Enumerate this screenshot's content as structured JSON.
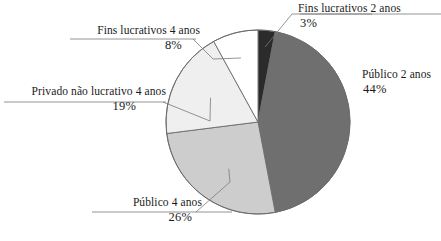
{
  "chart_data": {
    "type": "pie",
    "title": "",
    "subtitle": "",
    "xlabel": "",
    "ylabel": "",
    "legend_position": "callout-labels",
    "grid": false,
    "units": "percent",
    "categories": [
      "Fins lucrativos 2 anos",
      "Público 2 anos",
      "Público 4 anos",
      "Privado não lucrativo 4 anos",
      "Fins lucrativos 4 anos"
    ],
    "values": [
      3,
      44,
      26,
      19,
      8
    ],
    "value_labels": [
      "3%",
      "44%",
      "26%",
      "19%",
      "8%"
    ],
    "slice_colors": [
      "#2b2b2b",
      "#6f6f6f",
      "#cdcdcd",
      "#efefef",
      "#ffffff"
    ],
    "slices": [
      {
        "label": "Fins lucrativos 2 anos",
        "value": 3,
        "value_label": "3%",
        "color": "#2b2b2b",
        "start_angle_deg": 0,
        "end_angle_deg": 10.8
      },
      {
        "label": "Público 2 anos",
        "value": 44,
        "value_label": "44%",
        "color": "#6f6f6f",
        "start_angle_deg": 10.8,
        "end_angle_deg": 169.2
      },
      {
        "label": "Público 4 anos",
        "value": 26,
        "value_label": "26%",
        "color": "#cdcdcd",
        "start_angle_deg": 169.2,
        "end_angle_deg": 262.8
      },
      {
        "label": "Privado não lucrativo 4 anos",
        "value": 19,
        "value_label": "19%",
        "color": "#efefef",
        "start_angle_deg": 262.8,
        "end_angle_deg": 331.2
      },
      {
        "label": "Fins lucrativos 4 anos",
        "value": 8,
        "value_label": "8%",
        "color": "#ffffff",
        "start_angle_deg": 331.2,
        "end_angle_deg": 360
      }
    ]
  },
  "geometry": {
    "center_x": 258,
    "center_y": 122,
    "radius": 92,
    "outline_color": "#6b6b6b",
    "leader_color": "#7a7a7a"
  }
}
